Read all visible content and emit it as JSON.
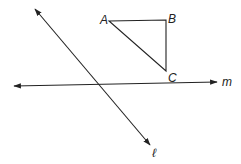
{
  "diagram": {
    "triangle": {
      "vertices": [
        {
          "label": "A",
          "x": 109,
          "y": 21
        },
        {
          "label": "B",
          "x": 166,
          "y": 20
        },
        {
          "label": "C",
          "x": 166,
          "y": 71
        }
      ]
    },
    "lines": [
      {
        "label": "ℓ",
        "x1": 35,
        "y1": 9,
        "x2": 150,
        "y2": 145
      },
      {
        "label": "m",
        "x1": 14,
        "y1": 86,
        "x2": 217,
        "y2": 82
      }
    ],
    "labels": {
      "A": "A",
      "B": "B",
      "C": "C",
      "l": "ℓ",
      "m": "m"
    },
    "colors": {
      "stroke": "#222222",
      "background": "#ffffff"
    }
  }
}
